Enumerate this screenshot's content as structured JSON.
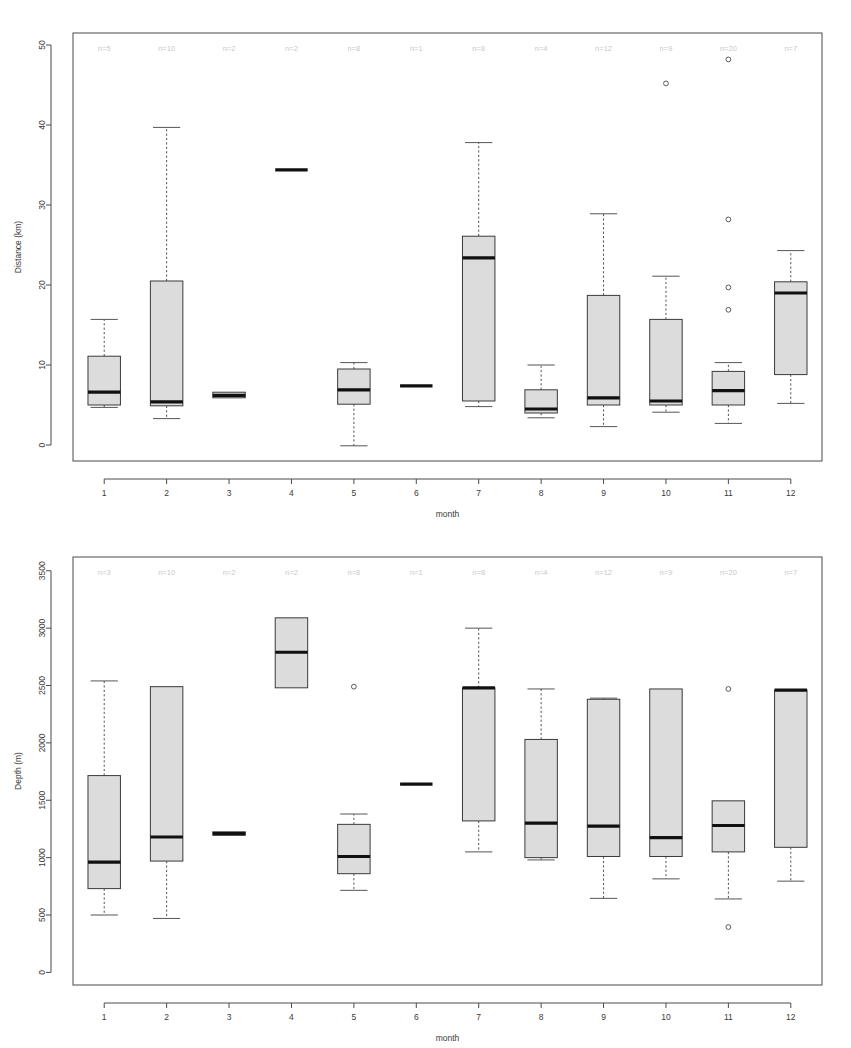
{
  "figure": {
    "title": "",
    "panel_count": 2,
    "background_color": "#ffffff",
    "box_fill_color": "#dcdcdc",
    "box_stroke_color": "#3a3a3a",
    "median_color": "#111111",
    "n_label_color": "#c9c9c9"
  },
  "chart_data": [
    {
      "type": "box",
      "id": "distance-boxplot",
      "title": "",
      "xlabel": "month",
      "ylabel": "Distance (km)",
      "categories": [
        "1",
        "2",
        "3",
        "4",
        "5",
        "6",
        "7",
        "8",
        "9",
        "10",
        "11",
        "12"
      ],
      "xtick_labels": [
        "1",
        "2",
        "3",
        "4",
        "5",
        "6",
        "7",
        "8",
        "9",
        "10",
        "11",
        "12"
      ],
      "ytick_labels": [
        "0",
        "10",
        "20",
        "30",
        "40",
        "50"
      ],
      "yticks": [
        0,
        10,
        20,
        30,
        40,
        50
      ],
      "ylim": [
        -2.0,
        51.5
      ],
      "grid": false,
      "legend": null,
      "annotations": [
        "n=5",
        "n=10",
        "n=2",
        "n=2",
        "n=8",
        "n=1",
        "n=8",
        "n=4",
        "n=12",
        "n=9",
        "n=20",
        "n=7"
      ],
      "counts": [
        5,
        10,
        2,
        2,
        8,
        1,
        8,
        4,
        12,
        9,
        20,
        7
      ],
      "boxes": [
        {
          "category": "1",
          "n": 5,
          "whisker_low": 4.7,
          "q1": 5.0,
          "median": 6.6,
          "q3": 11.1,
          "whisker_high": 15.7,
          "outliers": []
        },
        {
          "category": "2",
          "n": 10,
          "whisker_low": 3.3,
          "q1": 4.9,
          "median": 5.4,
          "q3": 20.5,
          "whisker_high": 39.7,
          "outliers": []
        },
        {
          "category": "3",
          "n": 2,
          "whisker_low": 5.9,
          "q1": 5.9,
          "median": 6.2,
          "q3": 6.6,
          "whisker_high": 6.6,
          "outliers": []
        },
        {
          "category": "4",
          "n": 2,
          "whisker_low": 34.4,
          "q1": 34.4,
          "median": 34.4,
          "q3": 34.4,
          "whisker_high": 34.4,
          "outliers": []
        },
        {
          "category": "5",
          "n": 8,
          "whisker_low": -0.1,
          "q1": 5.1,
          "median": 6.9,
          "q3": 9.5,
          "whisker_high": 10.3,
          "outliers": []
        },
        {
          "category": "6",
          "n": 1,
          "whisker_low": 7.4,
          "q1": 7.4,
          "median": 7.4,
          "q3": 7.4,
          "whisker_high": 7.4,
          "outliers": []
        },
        {
          "category": "7",
          "n": 8,
          "whisker_low": 4.8,
          "q1": 5.5,
          "median": 23.4,
          "q3": 26.1,
          "whisker_high": 37.8,
          "outliers": []
        },
        {
          "category": "8",
          "n": 4,
          "whisker_low": 3.4,
          "q1": 4.0,
          "median": 4.5,
          "q3": 6.9,
          "whisker_high": 10.0,
          "outliers": []
        },
        {
          "category": "9",
          "n": 12,
          "whisker_low": 2.3,
          "q1": 5.0,
          "median": 5.9,
          "q3": 18.7,
          "whisker_high": 28.9,
          "outliers": []
        },
        {
          "category": "10",
          "n": 9,
          "whisker_low": 4.1,
          "q1": 5.0,
          "median": 5.5,
          "q3": 15.7,
          "whisker_high": 21.1,
          "outliers": [
            45.2
          ]
        },
        {
          "category": "11",
          "n": 20,
          "whisker_low": 2.7,
          "q1": 5.0,
          "median": 6.8,
          "q3": 9.2,
          "whisker_high": 10.3,
          "outliers": [
            48.2,
            28.2,
            19.7,
            16.9
          ]
        },
        {
          "category": "12",
          "n": 7,
          "whisker_low": 5.2,
          "q1": 8.8,
          "median": 19.0,
          "q3": 20.4,
          "whisker_high": 24.3,
          "outliers": []
        }
      ]
    },
    {
      "type": "box",
      "id": "depth-boxplot",
      "title": "",
      "xlabel": "month",
      "ylabel": "Depth (m)",
      "categories": [
        "1",
        "2",
        "3",
        "4",
        "5",
        "6",
        "7",
        "8",
        "9",
        "10",
        "11",
        "12"
      ],
      "xtick_labels": [
        "1",
        "2",
        "3",
        "4",
        "5",
        "6",
        "7",
        "8",
        "9",
        "10",
        "11",
        "12"
      ],
      "ytick_labels": [
        "0",
        "500",
        "1000",
        "1500",
        "2000",
        "2500",
        "3000",
        "3500"
      ],
      "yticks": [
        0,
        500,
        1000,
        1500,
        2000,
        2500,
        3000,
        3500
      ],
      "ylim": [
        -110,
        3620
      ],
      "grid": false,
      "legend": null,
      "annotations": [
        "n=3",
        "n=10",
        "n=2",
        "n=2",
        "n=8",
        "n=1",
        "n=8",
        "n=4",
        "n=12",
        "n=9",
        "n=20",
        "n=7"
      ],
      "counts": [
        3,
        10,
        2,
        2,
        8,
        1,
        8,
        4,
        12,
        9,
        20,
        7
      ],
      "boxes": [
        {
          "category": "1",
          "n": 3,
          "whisker_low": 500,
          "q1": 730,
          "median": 960,
          "q3": 1715,
          "whisker_high": 2540,
          "outliers": []
        },
        {
          "category": "2",
          "n": 10,
          "whisker_low": 470,
          "q1": 970,
          "median": 1180,
          "q3": 2490,
          "whisker_high": 2490,
          "outliers": []
        },
        {
          "category": "3",
          "n": 2,
          "whisker_low": 1195,
          "q1": 1195,
          "median": 1210,
          "q3": 1225,
          "whisker_high": 1225,
          "outliers": []
        },
        {
          "category": "4",
          "n": 2,
          "whisker_low": 2480,
          "q1": 2480,
          "median": 2790,
          "q3": 3090,
          "whisker_high": 3090,
          "outliers": []
        },
        {
          "category": "5",
          "n": 8,
          "whisker_low": 715,
          "q1": 860,
          "median": 1010,
          "q3": 1290,
          "whisker_high": 1380,
          "outliers": [
            2490
          ]
        },
        {
          "category": "6",
          "n": 1,
          "whisker_low": 1640,
          "q1": 1640,
          "median": 1640,
          "q3": 1640,
          "whisker_high": 1640,
          "outliers": []
        },
        {
          "category": "7",
          "n": 8,
          "whisker_low": 1050,
          "q1": 1320,
          "median": 2480,
          "q3": 2480,
          "whisker_high": 3000,
          "outliers": []
        },
        {
          "category": "8",
          "n": 4,
          "whisker_low": 980,
          "q1": 1000,
          "median": 1300,
          "q3": 2030,
          "whisker_high": 2470,
          "outliers": []
        },
        {
          "category": "9",
          "n": 12,
          "whisker_low": 645,
          "q1": 1010,
          "median": 1275,
          "q3": 2380,
          "whisker_high": 2390,
          "outliers": []
        },
        {
          "category": "10",
          "n": 9,
          "whisker_low": 815,
          "q1": 1010,
          "median": 1175,
          "q3": 2470,
          "whisker_high": 2470,
          "outliers": []
        },
        {
          "category": "11",
          "n": 20,
          "whisker_low": 640,
          "q1": 1050,
          "median": 1280,
          "q3": 1495,
          "whisker_high": 1495,
          "outliers": [
            2470,
            395
          ]
        },
        {
          "category": "12",
          "n": 7,
          "whisker_low": 795,
          "q1": 1090,
          "median": 2460,
          "q3": 2460,
          "whisker_high": 2460,
          "outliers": []
        }
      ]
    }
  ]
}
